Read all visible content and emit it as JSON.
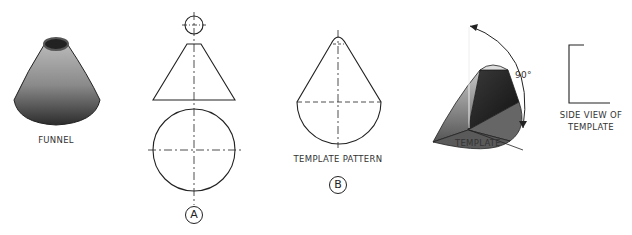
{
  "figures": {
    "funnel": {
      "label": "FUNNEL"
    },
    "view_a": {
      "marker": "A"
    },
    "template_pattern": {
      "label": "TEMPLATE PATTERN",
      "marker": "B"
    },
    "template": {
      "label": "TEMPLATE",
      "angle": "90°"
    },
    "side_view": {
      "label_line1": "SIDE VIEW OF",
      "label_line2": "TEMPLATE"
    }
  },
  "colors": {
    "line": "#222222",
    "shade_dark": "#2a2a2a",
    "shade_light": "#bdbdbd"
  }
}
